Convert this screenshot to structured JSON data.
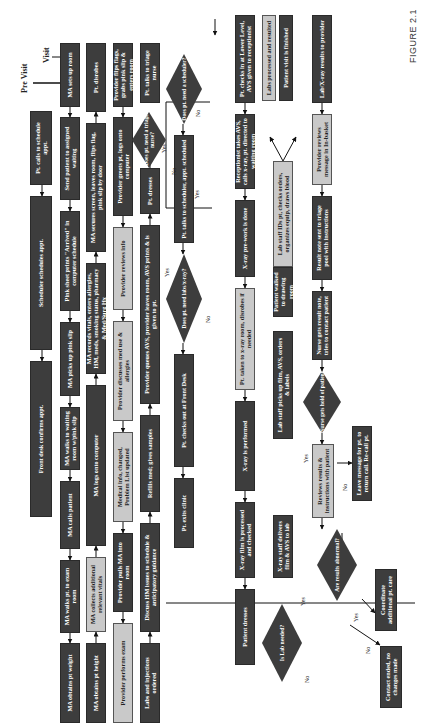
{
  "figure_label": "FIGURE 2.1",
  "phases": {
    "pre_visit": "Pre Visit",
    "visit": "Visit"
  },
  "pre_visit": [
    "Pt. calls to schedule appt.",
    "Scheduler schedules appt.",
    "Front desk confirms appt."
  ],
  "row1": [
    "MA sets up room",
    "Send patient to assigned waiting",
    "Pink sheet prints \"Arrived\" in computer schedule",
    "MA picks up pink slip",
    "MA walks to waiting room w/pink slip",
    "MA calls patient",
    "MA walks pt. to exam room",
    "MA obtains pt weight"
  ],
  "row2": [
    "Pt. disrobes",
    "MA secures screen, leaves room, flips flag, pink slip by door",
    "MA records vitals, enters allergies, HM, meds, smoking status, pharmacy & Med/Surg Hx",
    "MA logs onto computer",
    "MA collects additional relevant vitals",
    "MA obtains pt height"
  ],
  "row3": [
    "Provider flips flags, grabs pink slip & enters room",
    "Provider greets pt, logs onto computer",
    "Provider reviews info",
    "Provider discusses med use & allergies",
    "Medical info, changed, Problem List updated",
    "Provider pulls MA into room",
    "Provider performs exam"
  ],
  "row4": [
    "Pt. talks to triage nurse",
    "Pt. dresses",
    "Provider queues AVS, provider leaves room, AVS prints & is given to pt.",
    "Refills med; gives samples",
    "Discuss HM issues to schedule & anticipatory guidance",
    "Labs and injections ordered"
  ],
  "row5": [
    "Pt. talks to scheduler, appt. scheduled",
    "Pt. checks out at Front Desk",
    "Pt. exits clinic"
  ],
  "row6": [
    "Pt. checks in at Lower Level, AVS given to receptionist",
    "Receptionist takes AVS, calls x-ray, pt. directed to waiting room",
    "X-ray pre-work is done",
    "Pt. taken to x-ray room, disrobes if needed",
    "X-ray is performed",
    "X-ray film is processed and checked",
    "Patient dresses"
  ],
  "row7": [
    "Labs processed and resulted",
    "Patient visit is finished",
    "Lab staff IDs pt, checks orders, organizes equip, draws blood",
    "Patient walked to drawing room",
    "Lab staff picks up film, AVS, orders & labels",
    "X-ray staff delivers film & AVS to lab"
  ],
  "row8": [
    "Lab/X-ray results to provider",
    "Provider reviews message in In-basket",
    "Result note sent to triage pool with instructions",
    "Nurse gets result note, tries to contact patient",
    "Reviews results & instructions with patient"
  ],
  "row9": [
    "Leave message for pt. to return call. Re-call pt.",
    "Coordinate additional pt. care",
    "Contact ended, no changes made"
  ],
  "decisions": {
    "triage": "Does pt. need a triage nurse?",
    "scheduler": "Does pt. need a scheduler?",
    "labs": "Does pt. need labs/x-ray?",
    "lab_needed": "Is Lab needed?",
    "reach": "Nurse gets hold of patient",
    "abnormal": "Are results abnormal?"
  },
  "branch_labels": {
    "yes": "Yes",
    "no": "No"
  }
}
